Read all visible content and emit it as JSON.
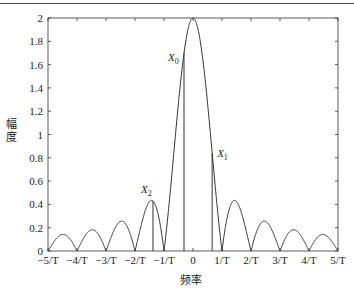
{
  "chart_data": {
    "type": "line",
    "title": "",
    "xlabel": "频率",
    "ylabel": "幅度",
    "xlim": [
      -5,
      5
    ],
    "ylim": [
      0,
      2
    ],
    "x_unit": "1/T",
    "xticks": [
      -5,
      -4,
      -3,
      -2,
      -1,
      0,
      1,
      2,
      3,
      4,
      5
    ],
    "xtick_labels": [
      "−5/T",
      "−4/T",
      "−3/T",
      "−2/T",
      "−1/T",
      "0",
      "1/T",
      "2/T",
      "3/T",
      "4/T",
      "5/T"
    ],
    "yticks": [
      0,
      0.2,
      0.4,
      0.6,
      0.8,
      1,
      1.2,
      1.4,
      1.6,
      1.8,
      2
    ],
    "ytick_labels": [
      "0",
      "0.2",
      "0.4",
      "0.6",
      "0.8",
      "1",
      "1.2",
      "1.4",
      "1.6",
      "1.8",
      "2"
    ],
    "grid": false,
    "series": [
      {
        "name": "magnitude |2·sinc(fT)|",
        "description": "Main lobe peak 2 at f=0; zeros at f=±k/T; sidelobe peaks ≈0.43, 0.26, 0.18, 0.14",
        "x": [
          -5,
          -4.5,
          -4,
          -3.5,
          -3,
          -2.5,
          -2,
          -1.5,
          -1,
          -0.5,
          0,
          0.5,
          1,
          1.5,
          2,
          2.5,
          3,
          3.5,
          4,
          4.5,
          5
        ],
        "y": [
          0,
          0.14,
          0,
          0.18,
          0,
          0.25,
          0,
          0.42,
          0,
          1.27,
          2,
          1.27,
          0,
          0.42,
          0,
          0.25,
          0,
          0.18,
          0,
          0.14,
          0
        ]
      }
    ],
    "markers": [
      {
        "label": "X0",
        "x": -0.31,
        "y": 1.7
      },
      {
        "label": "X1",
        "x": 0.66,
        "y": 0.84
      },
      {
        "label": "X2",
        "x": -1.38,
        "y": 0.43
      }
    ],
    "legend": null
  },
  "labels": {
    "xlabel": "频率",
    "ylabel": "幅度",
    "x0": "X",
    "x0_sub": "0",
    "x1": "X",
    "x1_sub": "1",
    "x2": "X",
    "x2_sub": "2"
  }
}
